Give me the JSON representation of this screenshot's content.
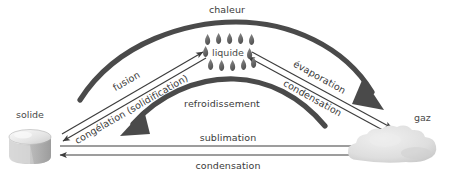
{
  "diagram": {
    "title_text": "chaleur",
    "language": "fr",
    "states": [
      {
        "id": "solide",
        "label": "solide",
        "icon": "ice-cube-icon",
        "x": 35,
        "y": 118
      },
      {
        "id": "liquide",
        "label": "liquide",
        "icon": "water-droplets-icon",
        "x": 228,
        "y": 55
      },
      {
        "id": "gaz",
        "label": "gaz",
        "icon": "gas-cloud-icon",
        "x": 409,
        "y": 118
      }
    ],
    "energy_arcs": [
      {
        "id": "chaleur",
        "label": "chaleur",
        "direction": "solide-to-gaz",
        "style": "thick-arc-up"
      },
      {
        "id": "refroidissement",
        "label": "refroidissement",
        "direction": "gaz-to-solide",
        "style": "thick-arc-down"
      }
    ],
    "transitions": [
      {
        "id": "fusion",
        "label": "fusion",
        "from": "solide",
        "to": "liquide"
      },
      {
        "id": "congelation",
        "label": "congélation (solidification)",
        "from": "liquide",
        "to": "solide"
      },
      {
        "id": "evaporation",
        "label": "évaporation",
        "from": "liquide",
        "to": "gaz"
      },
      {
        "id": "condensation-liquide",
        "label": "condensation",
        "from": "gaz",
        "to": "liquide"
      },
      {
        "id": "sublimation",
        "label": "sublimation",
        "from": "solide",
        "to": "gaz"
      },
      {
        "id": "condensation-solide",
        "label": "condensation",
        "from": "gaz",
        "to": "solide"
      }
    ],
    "colors": {
      "ink": "#3a3a3a",
      "arc": "#4a4a4a",
      "line": "#3d3d3d",
      "ice_light": "#f2f2f2",
      "ice_mid": "#cfcfcf",
      "ice_dark": "#9e9e9e",
      "cloud": "#dcdcdc",
      "droplet": "#6e6e6e",
      "background": "#ffffff"
    }
  }
}
